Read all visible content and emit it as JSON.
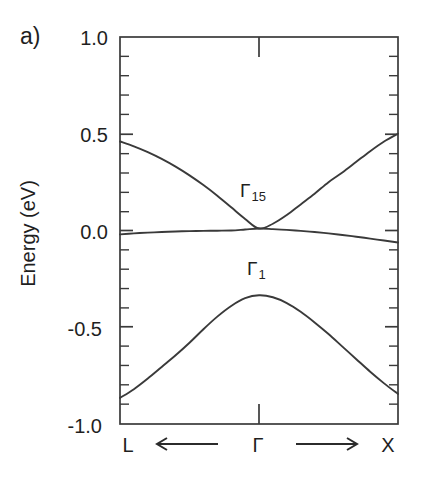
{
  "panel": {
    "label": "a)"
  },
  "axes": {
    "ylabel": "Energy (eV)",
    "yticks": [
      "1.0",
      "0.5",
      "0.0",
      "-0.5",
      "-1.0"
    ],
    "ylim": [
      -1.0,
      1.0
    ],
    "xticks": [
      "L",
      "Γ",
      "X"
    ],
    "xlim_labels": {
      "left": "L",
      "center": "Γ",
      "right": "X"
    },
    "arrows": {
      "left_arrow": "←",
      "right_arrow": "→"
    }
  },
  "annotations": {
    "upper_band": {
      "gamma": "Γ",
      "subscript": "15"
    },
    "lower_band": {
      "gamma": "Γ",
      "subscript": "1"
    }
  },
  "colors": {
    "axis": "#3a3a3a",
    "curve": "#3a3a3a",
    "text": "#1f1f1f",
    "background": "#ffffff"
  },
  "chart_data": {
    "type": "line",
    "title": "",
    "xlabel": "",
    "ylabel": "Energy (eV)",
    "ylim": [
      -1.0,
      1.0
    ],
    "xlim": [
      -1.0,
      1.0
    ],
    "x_tick_positions": [
      -1.0,
      0.0,
      1.0
    ],
    "x_tick_labels": [
      "L",
      "Γ",
      "X"
    ],
    "y_tick_values": [
      1.0,
      0.5,
      0.0,
      -0.5,
      -1.0
    ],
    "y_minor_tick_values": [
      0.9,
      0.8,
      0.7,
      0.6,
      0.4,
      0.3,
      0.2,
      0.1,
      -0.1,
      -0.2,
      -0.3,
      -0.4,
      -0.6,
      -0.7,
      -0.8,
      -0.9
    ],
    "grid": false,
    "legend": false,
    "annotations": [
      {
        "text": "Γ15",
        "x": -0.06,
        "y": 0.26
      },
      {
        "text": "Γ1",
        "x": -0.02,
        "y": -0.15
      }
    ],
    "series": [
      {
        "name": "upper band (Γ15 conduction branch)",
        "x": [
          -1.0,
          -0.9,
          -0.8,
          -0.7,
          -0.6,
          -0.5,
          -0.4,
          -0.3,
          -0.2,
          -0.1,
          0.0,
          0.1,
          0.2,
          0.3,
          0.4,
          0.5,
          0.6,
          0.7,
          0.8,
          0.9,
          1.0
        ],
        "y": [
          0.46,
          0.435,
          0.405,
          0.37,
          0.33,
          0.285,
          0.235,
          0.18,
          0.12,
          0.06,
          0.01,
          0.035,
          0.08,
          0.135,
          0.19,
          0.25,
          0.3,
          0.355,
          0.41,
          0.46,
          0.5
        ]
      },
      {
        "name": "flat band (Γ15 valence branch)",
        "x": [
          -1.0,
          -0.9,
          -0.8,
          -0.7,
          -0.6,
          -0.5,
          -0.4,
          -0.3,
          -0.2,
          -0.1,
          0.0,
          0.1,
          0.2,
          0.3,
          0.4,
          0.5,
          0.6,
          0.7,
          0.8,
          0.9,
          1.0
        ],
        "y": [
          -0.02,
          -0.015,
          -0.011,
          -0.008,
          -0.005,
          -0.003,
          -0.002,
          -0.001,
          0.0,
          0.005,
          0.01,
          0.007,
          0.003,
          -0.002,
          -0.008,
          -0.015,
          -0.023,
          -0.032,
          -0.042,
          -0.052,
          -0.062
        ]
      },
      {
        "name": "lower band (Γ1)",
        "x": [
          -1.0,
          -0.9,
          -0.8,
          -0.7,
          -0.6,
          -0.5,
          -0.4,
          -0.3,
          -0.2,
          -0.1,
          0.0,
          0.1,
          0.2,
          0.3,
          0.4,
          0.5,
          0.6,
          0.7,
          0.8,
          0.9,
          1.0
        ],
        "y": [
          -0.865,
          -0.82,
          -0.765,
          -0.705,
          -0.645,
          -0.58,
          -0.51,
          -0.445,
          -0.39,
          -0.35,
          -0.335,
          -0.345,
          -0.375,
          -0.42,
          -0.475,
          -0.535,
          -0.6,
          -0.665,
          -0.73,
          -0.79,
          -0.845
        ]
      }
    ]
  }
}
